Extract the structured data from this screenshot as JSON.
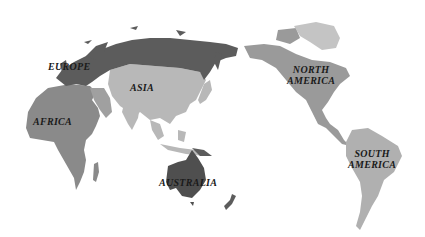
{
  "map": {
    "title": "World continents map (Pacific-centered)",
    "colors": {
      "background": "#ffffff",
      "europe_russia": "#5c5c5c",
      "asia": "#b8b8b8",
      "africa": "#8a8a8a",
      "australia": "#4f4f4f",
      "north_america": "#9a9a9a",
      "greenland": "#c4c4c4",
      "south_america": "#b0b0b0",
      "label": "#1a1a1a"
    },
    "labels": {
      "europe": "EUROPE",
      "asia": "ASIA",
      "africa": "AFRICA",
      "australia": "AUSTRALIA",
      "north_america_1": "NORTH",
      "north_america_2": "AMERICA",
      "south_america_1": "SOUTH",
      "south_america_2": "AMERICA"
    }
  }
}
